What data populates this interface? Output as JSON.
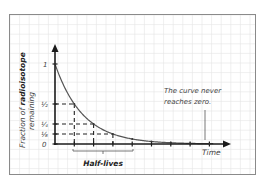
{
  "chart_data": {
    "type": "line",
    "title": "",
    "xlabel": "Time",
    "ylabel_prefix": "Fraction of ",
    "ylabel_bold": "radioisotope",
    "ylabel_line2": "remaining",
    "y_ticks": [
      "1",
      "½",
      "¼",
      "⅛",
      "0"
    ],
    "y_values": [
      1,
      0.5,
      0.25,
      0.125,
      0
    ],
    "x": [
      0,
      1,
      2,
      3,
      4,
      5,
      6,
      7,
      8
    ],
    "series": [
      {
        "name": "Fraction remaining",
        "values": [
          1,
          0.5,
          0.25,
          0.125,
          0.0625,
          0.03125,
          0.015625,
          0.0078125,
          0.00390625
        ]
      }
    ],
    "x_unit": "Half-lives",
    "annotation": "The curve never reaches zero.",
    "annotation_line1": "The curve never",
    "annotation_line2": "reaches zero.",
    "grid": true,
    "ylim": [
      0,
      1
    ],
    "xlim": [
      0,
      9
    ]
  },
  "colors": {
    "grid": "#e4e4e4",
    "border": "#8a8a8a",
    "axis": "#1a1a1a",
    "curve": "#555555",
    "text": "#444444"
  }
}
